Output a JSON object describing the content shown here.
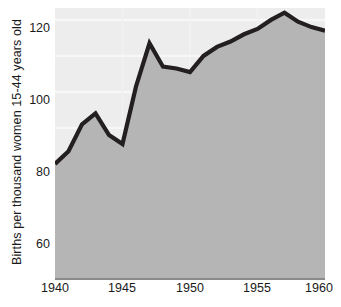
{
  "chart_data": {
    "type": "area",
    "title": "",
    "xlabel": "",
    "ylabel": "Births per thousand women 15-44 years old",
    "x": [
      1940,
      1941,
      1942,
      1943,
      1944,
      1945,
      1946,
      1947,
      1948,
      1949,
      1950,
      1951,
      1952,
      1953,
      1954,
      1955,
      1956,
      1957,
      1958,
      1959,
      1960
    ],
    "values": [
      80,
      83.5,
      91,
      94,
      88,
      85.5,
      101.5,
      113.5,
      107,
      106.5,
      105.5,
      110,
      112.5,
      114,
      116,
      117.5,
      120,
      122,
      119.5,
      118,
      117
    ],
    "series": [
      {
        "name": "Births per thousand women 15-44 years old",
        "values": [
          80,
          83.5,
          91,
          94,
          88,
          85.5,
          101.5,
          113.5,
          107,
          106.5,
          105.5,
          110,
          112.5,
          114,
          116,
          117.5,
          120,
          122,
          119.5,
          118,
          117
        ]
      }
    ],
    "xlim": [
      1940,
      1960
    ],
    "ylim": [
      48.3,
      123.3
    ],
    "xticks": [
      1940,
      1945,
      1950,
      1955,
      1960
    ],
    "xticklabels": [
      "1940",
      "1945",
      "1950",
      "1955",
      "1960"
    ],
    "yticks": [
      60,
      80,
      100,
      120
    ],
    "yticklabels": [
      "60",
      "80",
      "100",
      "120"
    ],
    "gridlines_y": [
      60,
      70,
      80,
      90,
      100,
      110,
      120
    ],
    "gridlines_x": [
      1945,
      1950,
      1955
    ],
    "grid": true,
    "legend": "none",
    "colors": {
      "line": "#231f20",
      "area_fill": "#b5b5b5",
      "plot_background": "#ededed",
      "gridline": "#f7f7f7",
      "vertical_gridline": "#f2f2f2",
      "axis_rule": "#8a8a8a",
      "text": "#1a1a1a",
      "page_background": "#ffffff"
    }
  },
  "axis": {
    "y_title": "Births per thousand women 15-44 years old",
    "y_labels": [
      "120",
      "100",
      "80",
      "60"
    ],
    "x_labels": [
      "1940",
      "1945",
      "1950",
      "1955",
      "1960"
    ]
  }
}
